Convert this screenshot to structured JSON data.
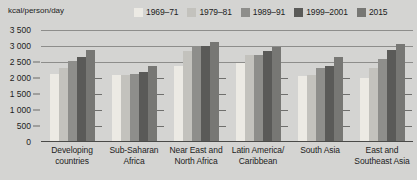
{
  "axis_title": "kcal/person/day",
  "legend": {
    "items": [
      {
        "label": "1969–71",
        "color": "#eceae4"
      },
      {
        "label": "1979–81",
        "color": "#c3c2bd"
      },
      {
        "label": "1989–91",
        "color": "#8e8e8b"
      },
      {
        "label": "1999–2001",
        "color": "#5a5a58"
      },
      {
        "label": "2015",
        "color": "#777774"
      }
    ]
  },
  "chart_data": {
    "type": "bar",
    "title": "",
    "xlabel": "",
    "ylabel": "kcal/person/day",
    "ylim": [
      0,
      3500
    ],
    "yticks": [
      "0",
      "500",
      "1 000",
      "1 500",
      "2 000",
      "2 500",
      "3 000",
      "3 500"
    ],
    "ytick_values": [
      0,
      500,
      1000,
      1500,
      2000,
      2500,
      3000,
      3500
    ],
    "grid": true,
    "legend_position": "top-right",
    "categories": [
      "Developing countries",
      "Sub-Saharan Africa",
      "Near East and North Africa",
      "Latin America/ Caribbean",
      "South Asia",
      "East and Southeast Asia"
    ],
    "category_lines": [
      [
        "Developing",
        "countries"
      ],
      [
        "Sub-Saharan",
        "Africa"
      ],
      [
        "Near East and",
        "North Africa"
      ],
      [
        "Latin America/",
        "Caribbean"
      ],
      [
        "South Asia"
      ],
      [
        "East and",
        "Southeast Asia"
      ]
    ],
    "series": [
      {
        "name": "1969–71",
        "color": "#eceae4",
        "values": [
          2110,
          2100,
          2380,
          2460,
          2070,
          2010
        ]
      },
      {
        "name": "1979–81",
        "color": "#c3c2bd",
        "values": [
          2320,
          2080,
          2840,
          2710,
          2080,
          2320
        ]
      },
      {
        "name": "1989–91",
        "color": "#8e8e8b",
        "values": [
          2540,
          2110,
          3010,
          2720,
          2320,
          2600
        ]
      },
      {
        "name": "1999–2001",
        "color": "#5a5a58",
        "values": [
          2650,
          2190,
          3010,
          2830,
          2390,
          2870
        ]
      },
      {
        "name": "2015",
        "color": "#777774",
        "values": [
          2860,
          2360,
          3120,
          2980,
          2660,
          3060
        ]
      }
    ]
  }
}
